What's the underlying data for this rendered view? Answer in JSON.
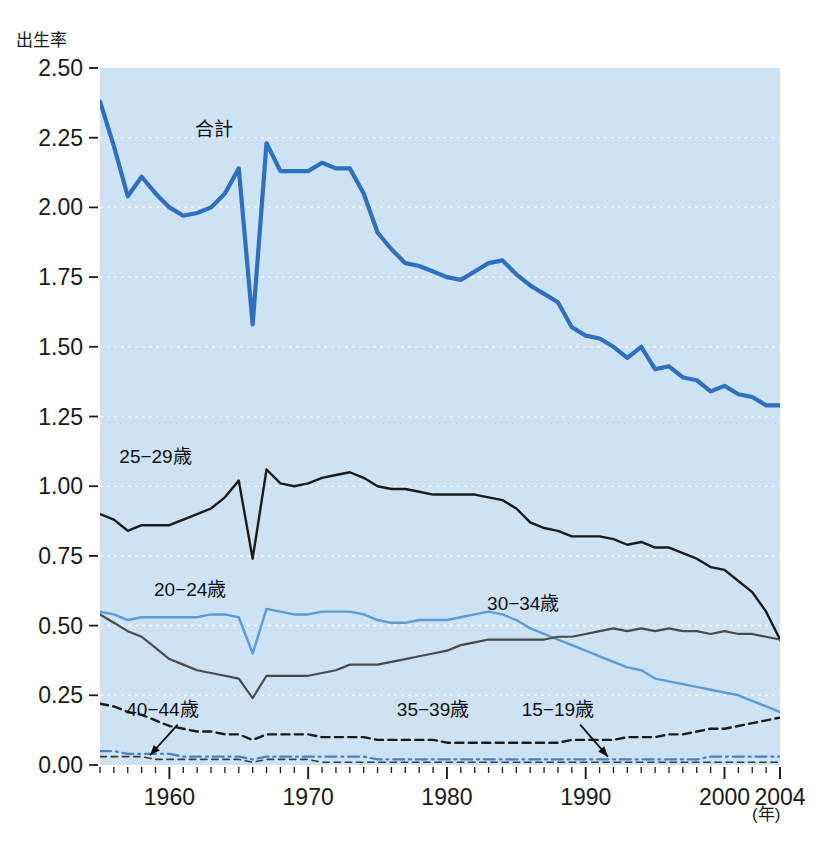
{
  "figure": {
    "y_axis_title": "出生率",
    "x_axis_title": "(年)",
    "faint_header": "　",
    "faint_footer": "　"
  },
  "chart_data": {
    "type": "line",
    "title": "",
    "subtitle": "",
    "xlabel": "(年)",
    "ylabel": "出生率",
    "xlim": [
      1955,
      2004
    ],
    "ylim": [
      0.0,
      2.5
    ],
    "grid": true,
    "grid_style": "dotted-white-horizontal",
    "legend_position": "inline-annotations",
    "plot_background": "#cde3f3",
    "page_background": "#ffffff",
    "x_ticks_major": [
      1960,
      1970,
      1980,
      1990,
      2000,
      2004
    ],
    "x_ticks_minor_step": 1,
    "y_ticks": [
      "0.00",
      "0.25",
      "0.50",
      "0.75",
      "1.00",
      "1.25",
      "1.50",
      "1.75",
      "2.00",
      "2.25",
      "2.50"
    ],
    "x": [
      1955,
      1956,
      1957,
      1958,
      1959,
      1960,
      1961,
      1962,
      1963,
      1964,
      1965,
      1966,
      1967,
      1968,
      1969,
      1970,
      1971,
      1972,
      1973,
      1974,
      1975,
      1976,
      1977,
      1978,
      1979,
      1980,
      1981,
      1982,
      1983,
      1984,
      1985,
      1986,
      1987,
      1988,
      1989,
      1990,
      1991,
      1992,
      1993,
      1994,
      1995,
      1996,
      1997,
      1998,
      1999,
      2000,
      2001,
      2002,
      2003,
      2004
    ],
    "series": [
      {
        "name": "合計",
        "label": "合計",
        "color": "#2f6fc0",
        "style": "solid",
        "width": 4.2,
        "label_x": 1963.2,
        "label_y": 2.255,
        "values": [
          2.38,
          2.22,
          2.04,
          2.11,
          2.05,
          2.0,
          1.97,
          1.98,
          2.0,
          2.05,
          2.14,
          1.58,
          2.23,
          2.13,
          2.13,
          2.13,
          2.16,
          2.14,
          2.14,
          2.05,
          1.91,
          1.85,
          1.8,
          1.79,
          1.77,
          1.75,
          1.74,
          1.77,
          1.8,
          1.81,
          1.76,
          1.72,
          1.69,
          1.66,
          1.57,
          1.54,
          1.53,
          1.5,
          1.46,
          1.5,
          1.42,
          1.43,
          1.39,
          1.38,
          1.34,
          1.36,
          1.33,
          1.32,
          1.29,
          1.29
        ]
      },
      {
        "name": "25-29歳",
        "label": "25−29歳",
        "color": "#1b1b1b",
        "style": "solid",
        "width": 2.4,
        "label_x": 1959.0,
        "label_y": 1.085,
        "values": [
          0.9,
          0.88,
          0.84,
          0.86,
          0.86,
          0.86,
          0.88,
          0.9,
          0.92,
          0.96,
          1.02,
          0.74,
          1.06,
          1.01,
          1.0,
          1.01,
          1.03,
          1.04,
          1.05,
          1.03,
          1.0,
          0.99,
          0.99,
          0.98,
          0.97,
          0.97,
          0.97,
          0.97,
          0.96,
          0.95,
          0.92,
          0.87,
          0.85,
          0.84,
          0.82,
          0.82,
          0.82,
          0.81,
          0.79,
          0.8,
          0.78,
          0.78,
          0.76,
          0.74,
          0.71,
          0.7,
          0.66,
          0.62,
          0.55,
          0.45
        ]
      },
      {
        "name": "20-24歳",
        "label": "20−24歳",
        "color": "#5c9bd6",
        "style": "solid",
        "width": 2.4,
        "label_x": 1961.5,
        "label_y": 0.605,
        "values": [
          0.55,
          0.54,
          0.52,
          0.53,
          0.53,
          0.53,
          0.53,
          0.53,
          0.54,
          0.54,
          0.53,
          0.4,
          0.56,
          0.55,
          0.54,
          0.54,
          0.55,
          0.55,
          0.55,
          0.54,
          0.52,
          0.51,
          0.51,
          0.52,
          0.52,
          0.52,
          0.53,
          0.54,
          0.55,
          0.54,
          0.52,
          0.49,
          0.47,
          0.45,
          0.43,
          0.41,
          0.39,
          0.37,
          0.35,
          0.34,
          0.31,
          0.3,
          0.29,
          0.28,
          0.27,
          0.26,
          0.25,
          0.23,
          0.21,
          0.19
        ]
      },
      {
        "name": "30-34歳",
        "label": "30−34歳",
        "color": "#4a4a4a",
        "style": "solid",
        "width": 2.2,
        "label_x": 1985.5,
        "label_y": 0.555,
        "values": [
          0.54,
          0.51,
          0.48,
          0.46,
          0.42,
          0.38,
          0.36,
          0.34,
          0.33,
          0.32,
          0.31,
          0.24,
          0.32,
          0.32,
          0.32,
          0.32,
          0.33,
          0.34,
          0.36,
          0.36,
          0.36,
          0.37,
          0.38,
          0.39,
          0.4,
          0.41,
          0.43,
          0.44,
          0.45,
          0.45,
          0.45,
          0.45,
          0.45,
          0.46,
          0.46,
          0.47,
          0.48,
          0.49,
          0.48,
          0.49,
          0.48,
          0.49,
          0.48,
          0.48,
          0.47,
          0.48,
          0.47,
          0.47,
          0.46,
          0.45
        ]
      },
      {
        "name": "35-39歳",
        "label": "35−39歳",
        "color": "#1b1b1b",
        "style": "dashed",
        "width": 2.4,
        "label_x": 1979.0,
        "label_y": 0.175,
        "values": [
          0.22,
          0.21,
          0.19,
          0.18,
          0.16,
          0.14,
          0.13,
          0.12,
          0.12,
          0.11,
          0.11,
          0.09,
          0.11,
          0.11,
          0.11,
          0.11,
          0.1,
          0.1,
          0.1,
          0.1,
          0.09,
          0.09,
          0.09,
          0.09,
          0.09,
          0.08,
          0.08,
          0.08,
          0.08,
          0.08,
          0.08,
          0.08,
          0.08,
          0.08,
          0.09,
          0.09,
          0.09,
          0.09,
          0.1,
          0.1,
          0.1,
          0.11,
          0.11,
          0.12,
          0.13,
          0.13,
          0.14,
          0.15,
          0.16,
          0.17
        ]
      },
      {
        "name": "15-19歳",
        "label": "15−19歳",
        "color": "#4a7fc1",
        "style": "dashdot",
        "width": 2.2,
        "label_x": 1988.0,
        "label_y": 0.175,
        "values": [
          0.05,
          0.05,
          0.04,
          0.04,
          0.04,
          0.04,
          0.03,
          0.03,
          0.03,
          0.03,
          0.03,
          0.02,
          0.03,
          0.03,
          0.03,
          0.03,
          0.03,
          0.03,
          0.03,
          0.03,
          0.02,
          0.02,
          0.02,
          0.02,
          0.02,
          0.02,
          0.02,
          0.02,
          0.02,
          0.02,
          0.02,
          0.02,
          0.02,
          0.02,
          0.02,
          0.02,
          0.02,
          0.02,
          0.02,
          0.02,
          0.02,
          0.02,
          0.02,
          0.02,
          0.03,
          0.03,
          0.03,
          0.03,
          0.03,
          0.03
        ]
      },
      {
        "name": "40-44歳",
        "label": "40−44歳",
        "color": "#3a3a3a",
        "style": "dashed-thin",
        "width": 1.6,
        "label_x": 1959.5,
        "label_y": 0.175,
        "values": [
          0.03,
          0.03,
          0.03,
          0.03,
          0.02,
          0.02,
          0.02,
          0.02,
          0.02,
          0.02,
          0.02,
          0.01,
          0.02,
          0.02,
          0.02,
          0.02,
          0.01,
          0.01,
          0.01,
          0.01,
          0.01,
          0.01,
          0.01,
          0.01,
          0.01,
          0.01,
          0.01,
          0.01,
          0.01,
          0.01,
          0.01,
          0.01,
          0.01,
          0.01,
          0.01,
          0.01,
          0.01,
          0.01,
          0.01,
          0.01,
          0.01,
          0.01,
          0.01,
          0.01,
          0.01,
          0.01,
          0.01,
          0.01,
          0.01,
          0.01
        ]
      }
    ],
    "annotations": [
      {
        "name": "arrow-40-44",
        "from_x": 1960.6,
        "from_y": 0.145,
        "to_x": 1958.6,
        "to_y": 0.035
      },
      {
        "name": "arrow-15-19",
        "from_x": 1989.6,
        "from_y": 0.145,
        "to_x": 1991.6,
        "to_y": 0.03
      }
    ]
  }
}
